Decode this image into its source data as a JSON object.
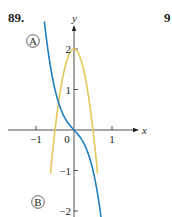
{
  "problem": {
    "number": "89.",
    "next_number_partial": "9"
  },
  "chart_data": {
    "type": "line",
    "title": "",
    "xlabel": "x",
    "ylabel": "y",
    "xlim": [
      -1.4,
      1.6
    ],
    "ylim": [
      -2.15,
      2.3
    ],
    "x_ticks": [
      -1,
      0,
      1
    ],
    "x_tick_labels": [
      "−1",
      "0",
      "1"
    ],
    "y_ticks": [
      -2,
      -1,
      1,
      2
    ],
    "y_tick_labels": [
      "−2",
      "−1",
      "1",
      "2"
    ],
    "grid": false,
    "legend": null,
    "series": [
      {
        "name": "A",
        "label": "Ⓐ",
        "color": "#1f7fc0",
        "description": "decreasing odd curve through origin",
        "x": [
          -0.78,
          -0.75,
          -0.6,
          -0.5,
          -0.4,
          -0.3,
          -0.2,
          -0.1,
          0,
          0.1,
          0.2,
          0.3,
          0.4,
          0.5,
          0.6,
          0.7,
          0.75
        ],
        "y": [
          2.68,
          2.44,
          1.46,
          1.0,
          0.66,
          0.41,
          0.23,
          0.1,
          0,
          -0.1,
          -0.23,
          -0.41,
          -0.66,
          -1.0,
          -1.46,
          -2.07,
          -2.44
        ]
      },
      {
        "name": "B",
        "label": "Ⓑ",
        "color": "#e3c85a",
        "description": "even curve with maximum 2 at x=0",
        "x": [
          -0.6,
          -0.5,
          -0.4,
          -0.3,
          -0.2,
          -0.1,
          0,
          0.1,
          0.2,
          0.3,
          0.4,
          0.5,
          0.6
        ],
        "y": [
          -0.88,
          0,
          0.72,
          1.28,
          1.68,
          1.92,
          2.0,
          1.92,
          1.68,
          1.28,
          0.72,
          0,
          -0.88
        ]
      }
    ],
    "annotations": [
      {
        "text": "A",
        "near": "blue curve, upper left"
      },
      {
        "text": "B",
        "near": "yellow curve, lower left"
      }
    ]
  },
  "labels": {
    "curve_a": "A",
    "curve_b": "B",
    "x_axis": "x",
    "y_axis": "y"
  }
}
